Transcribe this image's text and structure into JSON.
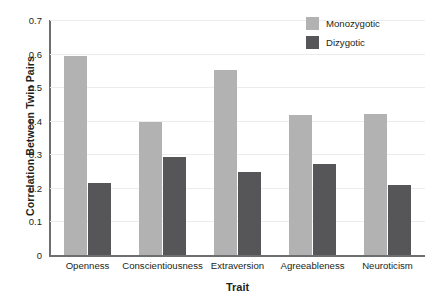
{
  "chart_data": {
    "type": "bar",
    "title": "",
    "xlabel": "Trait",
    "ylabel": "Correlation Between Twin Pairs",
    "categories": [
      "Openness",
      "Conscientiousness",
      "Extraversion",
      "Agreeableness",
      "Neuroticism"
    ],
    "series": [
      {
        "name": "Monozygotic",
        "color": "#b2b2b2",
        "values": [
          0.593,
          0.395,
          0.551,
          0.418,
          0.42
        ]
      },
      {
        "name": "Dizygotic",
        "color": "#565659",
        "values": [
          0.214,
          0.293,
          0.248,
          0.272,
          0.208
        ]
      }
    ],
    "ylim": [
      0,
      0.7
    ],
    "ytick_labels": [
      "0.7",
      "0.6",
      "0.5",
      "0.4",
      "0.3",
      "0.2",
      "0.1",
      "0"
    ],
    "ytick_values": [
      0.7,
      0.6,
      0.5,
      0.4,
      0.3,
      0.2,
      0.1,
      0
    ],
    "grid": true,
    "legend_position": "top-right"
  },
  "legend": {
    "entries": [
      {
        "label": "Monozygotic",
        "color": "#b2b2b2"
      },
      {
        "label": "Dizygotic",
        "color": "#565659"
      }
    ]
  },
  "colors": {
    "monozygotic": "#b2b2b2",
    "dizygotic": "#565659",
    "axis": "#6d6e71",
    "gridline": "#ececed",
    "text": "#231f20",
    "background": "#ffffff"
  }
}
